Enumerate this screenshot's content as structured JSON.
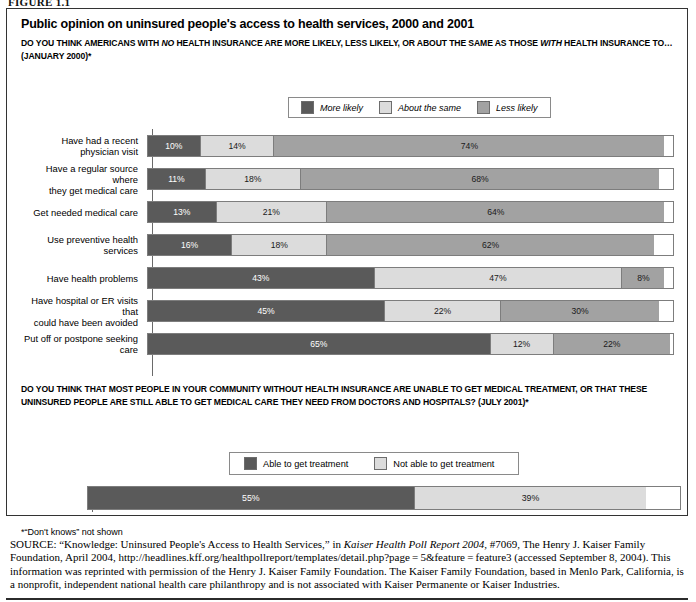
{
  "figure": {
    "label": "FIGURE 1.1"
  },
  "panel": {
    "title": "Public opinion on uninsured people's access to health services, 2000 and 2001",
    "question_1": {
      "part_a": "DO YOU THINK AMERICANS WITH ",
      "italic_1": "NO",
      "part_b": " HEALTH INSURANCE ARE MORE LIKELY, LESS LIKELY, OR ABOUT THE SAME AS THOSE ",
      "italic_2": "WITH",
      "part_c": " HEALTH INSURANCE TO… (JANUARY 2000)*"
    },
    "question_2": {
      "text": "DO YOU THINK THAT MOST PEOPLE IN YOUR COMMUNITY WITHOUT HEALTH INSURANCE ARE UNABLE TO GET MEDICAL TREATMENT, OR THAT THESE UNINSURED PEOPLE ARE STILL ABLE TO GET MEDICAL CARE THEY NEED FROM DOCTORS AND HOSPITALS? (JULY 2001)*"
    },
    "footnote": "*“Don't knows” not shown"
  },
  "colors": {
    "dark": "#5a5a5a",
    "light": "#dcdcdc",
    "mid": "#a2a2a2",
    "border": "#7d7d7d"
  },
  "legend_1": [
    {
      "label": "More likely",
      "color": "#5a5a5a"
    },
    {
      "label": "About the same",
      "color": "#dcdcdc"
    },
    {
      "label": "Less likely",
      "color": "#a2a2a2"
    }
  ],
  "legend_2": [
    {
      "label": "Able to get treatment",
      "color": "#5a5a5a"
    },
    {
      "label": "Not able to get treatment",
      "color": "#dcdcdc"
    }
  ],
  "chart_data": [
    {
      "type": "bar",
      "orientation": "horizontal",
      "stacked": true,
      "title": "Public opinion on uninsured people's access to health services, January 2000",
      "xlabel": "",
      "ylabel": "",
      "xlim": [
        0,
        100
      ],
      "grid": false,
      "legend_position": "top",
      "legend_entries": [
        "More likely",
        "About the same",
        "Less likely"
      ],
      "categories": [
        "Have had a recent physician visit",
        "Have a regular source where they get medical care",
        "Get needed medical care",
        "Use preventive health services",
        "Have health problems",
        "Have hospital or ER visits that could have been avoided",
        "Put off or postpone seeking care"
      ],
      "series": [
        {
          "name": "More likely",
          "values": [
            10,
            11,
            13,
            16,
            43,
            45,
            65
          ]
        },
        {
          "name": "About the same",
          "values": [
            14,
            18,
            21,
            18,
            47,
            22,
            12
          ]
        },
        {
          "name": "Less likely",
          "values": [
            74,
            68,
            64,
            62,
            8,
            30,
            22
          ]
        }
      ],
      "labels": [
        [
          "10%",
          "14%",
          "74%"
        ],
        [
          "11%",
          "18%",
          "68%"
        ],
        [
          "13%",
          "21%",
          "64%"
        ],
        [
          "16%",
          "18%",
          "62%"
        ],
        [
          "43%",
          "47%",
          "8%"
        ],
        [
          "45%",
          "22%",
          "30%"
        ],
        [
          "65%",
          "12%",
          "22%"
        ]
      ]
    },
    {
      "type": "bar",
      "orientation": "horizontal",
      "stacked": true,
      "title": "Ability of uninsured people in your community to get medical care, July 2001",
      "xlabel": "",
      "ylabel": "",
      "xlim": [
        0,
        100
      ],
      "grid": false,
      "legend_position": "top",
      "legend_entries": [
        "Able to get treatment",
        "Not able to get treatment"
      ],
      "categories": [
        ""
      ],
      "series": [
        {
          "name": "Able to get treatment",
          "values": [
            55
          ]
        },
        {
          "name": "Not able to get treatment",
          "values": [
            39
          ]
        }
      ],
      "labels": [
        [
          "55%",
          "39%"
        ]
      ]
    }
  ],
  "rows_1": [
    {
      "label": "Have had a recent\nphysician visit",
      "segs": [
        10,
        14,
        74
      ],
      "labels": [
        "10%",
        "14%",
        "74%"
      ]
    },
    {
      "label": "Have a regular source where\nthey get medical care",
      "segs": [
        11,
        18,
        68
      ],
      "labels": [
        "11%",
        "18%",
        "68%"
      ]
    },
    {
      "label": "Get needed medical care",
      "segs": [
        13,
        21,
        64
      ],
      "labels": [
        "13%",
        "21%",
        "64%"
      ]
    },
    {
      "label": "Use preventive health services",
      "segs": [
        16,
        18,
        62
      ],
      "labels": [
        "16%",
        "18%",
        "62%"
      ]
    },
    {
      "label": "Have health problems",
      "segs": [
        43,
        47,
        8
      ],
      "labels": [
        "43%",
        "47%",
        "8%"
      ]
    },
    {
      "label": "Have hospital or ER visits that\ncould have been avoided",
      "segs": [
        45,
        22,
        30
      ],
      "labels": [
        "45%",
        "22%",
        "30%"
      ]
    },
    {
      "label": "Put off or postpone seeking care",
      "segs": [
        65,
        12,
        22
      ],
      "labels": [
        "65%",
        "12%",
        "22%"
      ]
    }
  ],
  "rows_2": [
    {
      "label": "",
      "segs": [
        55,
        39
      ],
      "labels": [
        "55%",
        "39%"
      ]
    }
  ],
  "source": {
    "prefix": "SOURCE:",
    "text_1": " “Knowledge: Uninsured People's Access to Health Services,” in ",
    "italic_1": "Kaiser Health Poll Report 2004,",
    "text_2": " #7069, The Henry J. Kaiser Family Foundation, April 2004, http://headlines.kff.org/healthpollreport/templates/detail.php?page = 5&feature = feature3 (accessed September 8, 2004). This information was reprinted with permission of the Henry J. Kaiser Family Foundation. The Kaiser Family Foundation, based in Menlo Park, California, is a nonprofit, independent national health care philanthropy and is not associated with Kaiser Permanente or Kaiser Industries."
  }
}
